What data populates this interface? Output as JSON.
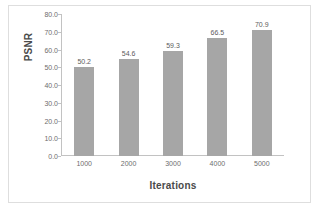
{
  "chart_data": {
    "type": "bar",
    "title": "",
    "xlabel": "Iterations",
    "ylabel": "PSNR",
    "categories": [
      "1000",
      "2000",
      "3000",
      "4000",
      "5000"
    ],
    "values": [
      50.2,
      54.6,
      59.3,
      66.5,
      70.9
    ],
    "data_labels": [
      "50.2",
      "54.6",
      "59.3",
      "66.5",
      "70.9"
    ],
    "ylim": [
      0.0,
      80.0
    ],
    "ytick_step": 10.0,
    "ytick_labels": [
      "80.0",
      "70.0",
      "60.0",
      "50.0",
      "40.0",
      "30.0",
      "20.0",
      "10.0",
      "0.0"
    ],
    "ytick_values": [
      80.0,
      70.0,
      60.0,
      50.0,
      40.0,
      30.0,
      20.0,
      10.0,
      0.0
    ],
    "grid": false,
    "legend": false,
    "legend_position": "none",
    "series": [
      {
        "name": "PSNR",
        "values": [
          50.2,
          54.6,
          59.3,
          66.5,
          70.9
        ]
      }
    ],
    "colors": {
      "bar": "#a6a6a6",
      "axis": "#c2c2c2",
      "tick_text": "#6d6d6d",
      "axis_title": "#4a4a4a",
      "data_label": "#5c5c5c",
      "background": "#ffffff",
      "frame": "#dedede"
    }
  }
}
